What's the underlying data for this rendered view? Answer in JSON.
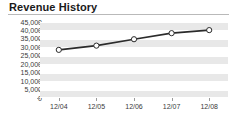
{
  "chart_data": {
    "type": "line",
    "title": "Revenue History",
    "xlabel": "",
    "ylabel": "",
    "categories": [
      "12/04",
      "12/05",
      "12/06",
      "12/07",
      "12/08"
    ],
    "values": [
      28500,
      31000,
      34800,
      38400,
      40200
    ],
    "series": [
      {
        "name": "Revenue",
        "values": [
          28500,
          31000,
          34800,
          38400,
          40200
        ]
      }
    ],
    "ylim": [
      0,
      45000
    ],
    "yticks": [
      0,
      5000,
      10000,
      15000,
      20000,
      25000,
      30000,
      35000,
      40000,
      45000
    ],
    "ytick_labels": [
      "0",
      "5,000",
      "10,000",
      "15,000",
      "20,000",
      "25,000",
      "30,000",
      "35,000",
      "40,000",
      "45,000"
    ],
    "xtick_labels": [
      "12/04",
      "12/05",
      "12/06",
      "12/07",
      "12/08"
    ],
    "grid": true,
    "legend": false,
    "legend_position": "none",
    "line_color": "#2b2b2b",
    "marker_face_color": "#ffffff",
    "marker_edge_color": "#2b2b2b",
    "band_color": "#e8e8e8",
    "gridline_color": "#ffffff",
    "plot_background": "#ffffff",
    "title_rule_color": "#b9b9b9",
    "axis_text_color": "#3a3a3a"
  }
}
